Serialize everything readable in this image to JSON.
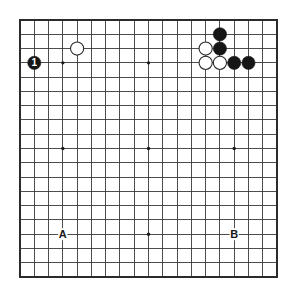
{
  "board": {
    "title": "Go board diagram",
    "size": 19,
    "origin_x": 20,
    "origin_y": 20,
    "spacing": 14.28,
    "line_color": "#3a3a3a",
    "border_color": "#2b2b2b",
    "background_color": "#ffffff",
    "star_point_color": "#1a1a1a",
    "star_point_rows": [
      4,
      10,
      16
    ],
    "star_point_cols": [
      4,
      10,
      16
    ],
    "stone_radius": 6.6,
    "black_color": "#161616",
    "white_color": "#ffffff",
    "white_edge_color": "#2b2b2b"
  },
  "stones": [
    {
      "id": "move-1",
      "color": "black",
      "col": 2,
      "row": 4,
      "number": "1"
    },
    {
      "id": "white-c5r3",
      "color": "white",
      "col": 5,
      "row": 3,
      "number": ""
    },
    {
      "id": "black-c15r2",
      "color": "black",
      "col": 15,
      "row": 2,
      "number": ""
    },
    {
      "id": "black-c15r3",
      "color": "black",
      "col": 15,
      "row": 3,
      "number": ""
    },
    {
      "id": "white-c14r3",
      "color": "white",
      "col": 14,
      "row": 3,
      "number": ""
    },
    {
      "id": "white-c14r4",
      "color": "white",
      "col": 14,
      "row": 4,
      "number": ""
    },
    {
      "id": "white-c15r4",
      "color": "white",
      "col": 15,
      "row": 4,
      "number": ""
    },
    {
      "id": "black-c16r4",
      "color": "black",
      "col": 16,
      "row": 4,
      "number": ""
    },
    {
      "id": "black-c17r4",
      "color": "black",
      "col": 17,
      "row": 4,
      "number": ""
    }
  ],
  "point_labels": [
    {
      "id": "label-a",
      "text": "A",
      "col": 4,
      "row": 16
    },
    {
      "id": "label-b",
      "text": "B",
      "col": 16,
      "row": 16
    }
  ]
}
